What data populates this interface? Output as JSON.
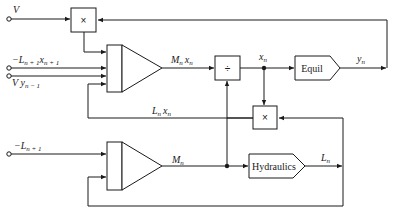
{
  "diagram": {
    "inputs": {
      "V": "V",
      "neg_L_next_x_next": "−L",
      "neg_L_next_x_next_sub1": "n + 1",
      "neg_L_next_x_next_var": "x",
      "neg_L_next_x_next_sub2": "n + 1",
      "V_y_prev": "V y",
      "V_y_prev_sub": "n − 1",
      "neg_L_next": "−L",
      "neg_L_next_sub": "n + 1"
    },
    "blocks": {
      "multiply_top": "×",
      "divide": "÷",
      "multiply_mid": "×",
      "equil": "Equil",
      "hydraulics": "Hydraulics"
    },
    "signals": {
      "Mn_xn": "M",
      "Mn_xn_sub": "n",
      "Mn_xn_var": "x",
      "Mn_xn_var_sub": "n",
      "xn": "x",
      "xn_sub": "n",
      "yn": "y",
      "yn_sub": "n",
      "Ln_xn": "L",
      "Ln_xn_sub": "n",
      "Ln_xn_var": "x",
      "Ln_xn_var_sub": "n",
      "Mn": "M",
      "Mn_sub": "n",
      "Ln": "L",
      "Ln_sub": "n"
    }
  }
}
